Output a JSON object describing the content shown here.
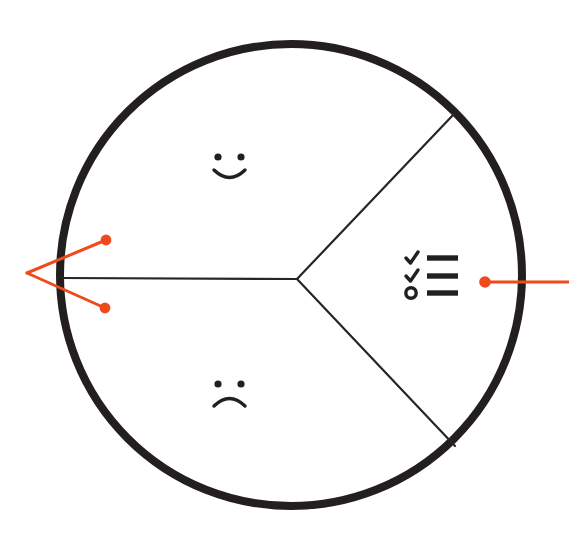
{
  "canvas": {
    "width": 569,
    "height": 547,
    "background_color": "#ffffff"
  },
  "colors": {
    "ink": "#231f1e",
    "annotation": "#ef4a1c",
    "divider": "#2a2523",
    "background": "#ffffff"
  },
  "diagram": {
    "title": "Sectored circle with smiley, sad face and checklist",
    "shape": "circle",
    "circle": {
      "center_x": 291,
      "center_y": 275,
      "radius": 231,
      "stroke_width": 8,
      "stroke_color": "#231f1e",
      "fill": "none"
    },
    "hub": {
      "x": 297,
      "y": 279,
      "label": "sector-junction"
    },
    "dividers": [
      {
        "name": "divider-left-horizontal",
        "from_x": 297,
        "from_y": 279,
        "to_x": 62,
        "to_y": 278,
        "stroke_width": 2.2
      },
      {
        "name": "divider-upper-right",
        "from_x": 297,
        "from_y": 279,
        "to_x": 454,
        "to_y": 114,
        "stroke_width": 2.2
      },
      {
        "name": "divider-lower-right",
        "from_x": 297,
        "from_y": 279,
        "to_x": 455,
        "to_y": 446,
        "stroke_width": 2.2
      }
    ],
    "sectors": [
      {
        "id": "sector-upper-left",
        "label": "Happy",
        "icon": "smiley-face-icon",
        "icon_center_x": 230,
        "icon_center_y": 166
      },
      {
        "id": "sector-lower-left",
        "label": "Unhappy",
        "icon": "sad-face-icon",
        "icon_center_x": 230,
        "icon_center_y": 393
      },
      {
        "id": "sector-right",
        "label": "Checklist",
        "icon": "checklist-icon",
        "icon_center_x": 431,
        "icon_center_y": 276
      }
    ]
  },
  "icons": {
    "smiley_face": {
      "name": "smiley-face-icon",
      "eye_radius": 3.6,
      "eye_left_x": 218,
      "eye_left_y": 157,
      "eye_right_x": 241,
      "eye_right_y": 157,
      "mouth_stroke_width": 3.4,
      "expression": "smile"
    },
    "sad_face": {
      "name": "sad-face-icon",
      "eye_radius": 3.6,
      "eye_left_x": 218,
      "eye_left_y": 384,
      "eye_right_x": 241,
      "eye_right_y": 384,
      "mouth_stroke_width": 3.4,
      "expression": "frown"
    },
    "checklist": {
      "name": "checklist-icon",
      "rows": [
        {
          "marker": "check",
          "bar": true
        },
        {
          "marker": "check",
          "bar": true
        },
        {
          "marker": "circle",
          "bar": true
        }
      ],
      "bar_x": 427,
      "bar_width": 31,
      "bar_height": 5.4,
      "row_y": [
        258,
        276,
        293
      ],
      "marker_x": 411,
      "marker_stroke_width": 3.4,
      "circle_radius": 5.2
    }
  },
  "annotations": [
    {
      "id": "callout-left",
      "name": "callout-left-pair",
      "color": "#ef4a1c",
      "vertex_x": 27,
      "vertex_y": 273,
      "stroke_width": 3,
      "endpoints": [
        {
          "name": "callout-dot-upper-left",
          "x": 106,
          "y": 240,
          "dot_radius": 5.4
        },
        {
          "name": "callout-dot-lower-left",
          "x": 105,
          "y": 308,
          "dot_radius": 5.4
        }
      ]
    },
    {
      "id": "callout-right",
      "name": "callout-right-single",
      "color": "#ef4a1c",
      "stroke_width": 3,
      "line_from_x": 569,
      "line_from_y": 282,
      "line_to_x": 485,
      "line_to_y": 282,
      "endpoints": [
        {
          "name": "callout-dot-right",
          "x": 485,
          "y": 282,
          "dot_radius": 5.8
        }
      ]
    }
  ]
}
